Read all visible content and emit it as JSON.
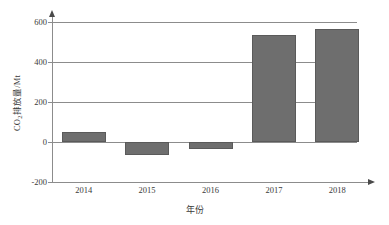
{
  "chart_data": {
    "type": "bar",
    "title": "",
    "subtitle": "",
    "categories": [
      "2014",
      "2015",
      "2016",
      "2017",
      "2018"
    ],
    "values": [
      50,
      -64,
      -37,
      537,
      564
    ],
    "series": [
      {
        "name": "CO2排放量",
        "values": [
          50,
          -64,
          -37,
          537,
          564
        ]
      }
    ],
    "xlabel": "年份",
    "ylabel": "CO₂排放量/Mt",
    "ylabel_prefix": "CO",
    "ylabel_sub": "2",
    "ylabel_suffix": "排放量/Mt",
    "ylim": [
      -200,
      600
    ],
    "yticks": [
      600,
      400,
      200,
      0,
      -200
    ],
    "ytick_labels": [
      "600",
      "400",
      "200",
      "0",
      "-200"
    ],
    "grid": true,
    "legend": false,
    "legend_position": "none",
    "bar_color": "#6e6e6e",
    "axis_color": "#8c8c8c",
    "annotations": []
  },
  "axes": {
    "y_arrow_icon": "arrow-up-icon",
    "x_arrow_icon": "arrow-right-icon"
  }
}
